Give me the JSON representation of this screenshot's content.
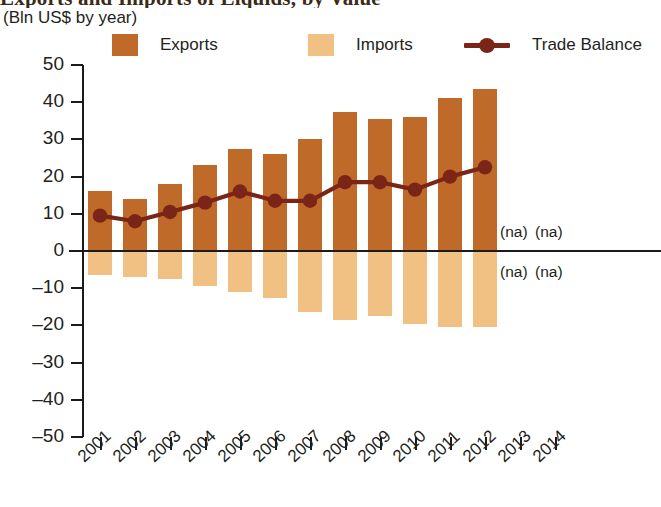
{
  "header": {
    "title": "Exports and Imports of Liquids, by Value",
    "subtitle": "(Bln US$ by year)"
  },
  "legend": {
    "items": [
      {
        "label": "Exports",
        "marker": "square-swatch",
        "color": "#C06A2A"
      },
      {
        "label": "Imports",
        "marker": "square-swatch",
        "color": "#F0C183"
      },
      {
        "label": "Trade Balance",
        "marker": "line-with-dot",
        "color": "#7B2518"
      }
    ]
  },
  "annotations": {
    "na_label": "(na)",
    "na_cells": [
      {
        "year": "2013",
        "position": "above-axis"
      },
      {
        "year": "2014",
        "position": "above-axis"
      },
      {
        "year": "2013",
        "position": "below-axis"
      },
      {
        "year": "2014",
        "position": "below-axis"
      }
    ]
  },
  "chart_data": {
    "type": "bar",
    "title": "Exports and Imports of Liquids, by Value",
    "subtitle": "(Bln US$ by year)",
    "xlabel": "",
    "ylabel": "(Bln US$ by year)",
    "ylim": [
      -50,
      50
    ],
    "yticks": [
      50,
      40,
      30,
      20,
      10,
      0,
      -10,
      -20,
      -30,
      -40,
      -50
    ],
    "ytick_labels": [
      "50",
      "40",
      "30",
      "20",
      "10",
      "0",
      "–10",
      "–20",
      "–30",
      "–40",
      "–50"
    ],
    "grid": false,
    "legend_position": "top",
    "categories": [
      "2001",
      "2002",
      "2003",
      "2004",
      "2005",
      "2006",
      "2007",
      "2008",
      "2009",
      "2010",
      "2011",
      "2012",
      "2013",
      "2014"
    ],
    "series": [
      {
        "name": "Exports",
        "type": "bar",
        "color": "#C06A2A",
        "values": [
          16,
          14,
          18,
          23,
          27.5,
          26,
          30,
          37.5,
          35.5,
          36,
          41,
          43.5,
          null,
          null
        ]
      },
      {
        "name": "Imports",
        "type": "bar",
        "color": "#F0C183",
        "values": [
          -6.5,
          -7,
          -7.5,
          -9.5,
          -11,
          -12.5,
          -16.5,
          -18.5,
          -17.5,
          -19.5,
          -20.5,
          -20.5,
          null,
          null
        ]
      },
      {
        "name": "Trade Balance",
        "type": "line",
        "color": "#7B2518",
        "values": [
          9.5,
          8,
          10.5,
          13,
          16,
          13.5,
          13.5,
          18.5,
          18.5,
          16.5,
          20,
          22.5,
          null,
          null
        ]
      }
    ]
  }
}
